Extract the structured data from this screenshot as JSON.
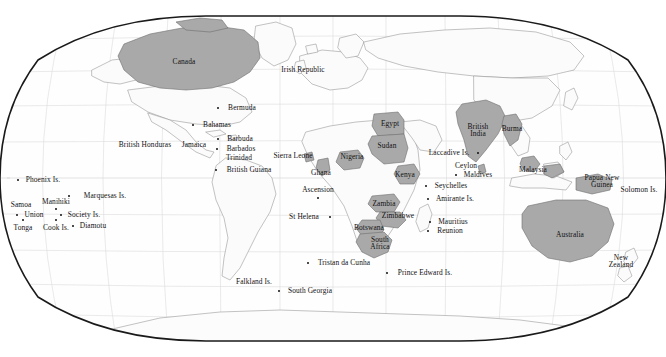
{
  "map": {
    "title": "World Map",
    "projection": "Robinson",
    "colors": {
      "ocean": "#ffffff",
      "land": "#fdfdfd",
      "land_outline": "#8b8b8b",
      "highlight_fill": "#a9a9a9",
      "highlight_outline": "#6e6e6e",
      "graticule": "#d8d8d8",
      "frame": "#1a1a1a",
      "label_text": "#111111"
    },
    "graticule": {
      "visible": true,
      "parallels": [
        75,
        60,
        45,
        30,
        15,
        0,
        -15,
        -30,
        -45,
        -60
      ],
      "meridians": [
        -180,
        -150,
        -120,
        -90,
        -60,
        -30,
        0,
        30,
        60,
        90,
        120,
        150,
        180
      ]
    },
    "labels": [
      {
        "name": "canada",
        "text": "Canada",
        "x": 184,
        "y": 62,
        "dot": false
      },
      {
        "name": "irish-republic",
        "text": "Irish Republic",
        "x": 303,
        "y": 70,
        "dot": false
      },
      {
        "name": "bermuda",
        "text": "Bermuda",
        "x": 242,
        "y": 108,
        "dot": true,
        "dx": -24
      },
      {
        "name": "bahamas",
        "text": "Bahamas",
        "x": 217,
        "y": 125,
        "dot": true,
        "dx": -24
      },
      {
        "name": "barbuda",
        "text": "Barbuda",
        "x": 240,
        "y": 139,
        "dot": true,
        "dx": -22
      },
      {
        "name": "barbados",
        "text": "Barbados",
        "x": 241,
        "y": 149,
        "dot": true,
        "dx": -24
      },
      {
        "name": "trinidad",
        "text": "Trinidad",
        "x": 239,
        "y": 158,
        "dot": false
      },
      {
        "name": "british-honduras",
        "text": "British Honduras",
        "x": 145,
        "y": 145,
        "dot": false
      },
      {
        "name": "jamaica",
        "text": "Jamaica",
        "x": 194,
        "y": 145,
        "dot": false
      },
      {
        "name": "british-guiana",
        "text": "British Guiana",
        "x": 249,
        "y": 170,
        "dot": true,
        "dx": -33
      },
      {
        "name": "sierra-leone",
        "text": "Sierra Leone",
        "x": 293,
        "y": 156,
        "dot": false
      },
      {
        "name": "ghana",
        "text": "Ghana",
        "x": 321,
        "y": 173,
        "dot": false
      },
      {
        "name": "nigeria",
        "text": "Nigeria",
        "x": 352,
        "y": 157,
        "dot": false
      },
      {
        "name": "egypt",
        "text": "Egypt",
        "x": 390,
        "y": 124,
        "dot": false
      },
      {
        "name": "sudan",
        "text": "Sudan",
        "x": 387,
        "y": 146,
        "dot": false
      },
      {
        "name": "kenya",
        "text": "Kenya",
        "x": 405,
        "y": 175,
        "dot": false
      },
      {
        "name": "zambia",
        "text": "Zambia",
        "x": 384,
        "y": 204,
        "dot": false
      },
      {
        "name": "zimbabwe",
        "text": "Zimbabwe",
        "x": 398,
        "y": 216,
        "dot": false
      },
      {
        "name": "botswana",
        "text": "Botswana",
        "x": 369,
        "y": 228,
        "dot": false
      },
      {
        "name": "south-africa",
        "text": "South\nAfrica",
        "x": 380,
        "y": 243,
        "dot": false
      },
      {
        "name": "ascension",
        "text": "Ascension",
        "x": 318,
        "y": 190,
        "dot": true,
        "dx": 0,
        "dy": 8
      },
      {
        "name": "st-helena",
        "text": "St Helena",
        "x": 304,
        "y": 217,
        "dot": true,
        "dx": 26
      },
      {
        "name": "tristan-da-cunha",
        "text": "Tristan da Cunha",
        "x": 344,
        "y": 263,
        "dot": true,
        "dx": -36
      },
      {
        "name": "prince-edward-is",
        "text": "Prince Edward Is.",
        "x": 425,
        "y": 273,
        "dot": true,
        "dx": -38
      },
      {
        "name": "south-georgia",
        "text": "South Georgia",
        "x": 310,
        "y": 291,
        "dot": true,
        "dx": -31
      },
      {
        "name": "falkland-is",
        "text": "Falkland Is.",
        "x": 254,
        "y": 282,
        "dot": false
      },
      {
        "name": "laccadive-is",
        "text": "Laccadive Is.",
        "x": 449,
        "y": 153,
        "dot": true,
        "dx": 29
      },
      {
        "name": "ceylon",
        "text": "Ceylon",
        "x": 466,
        "y": 166,
        "dot": false
      },
      {
        "name": "maldives",
        "text": "Maldives",
        "x": 478,
        "y": 175,
        "dot": true,
        "dx": -22
      },
      {
        "name": "british-india",
        "text": "British\nIndia",
        "x": 478,
        "y": 130,
        "dot": false
      },
      {
        "name": "burma",
        "text": "Burma",
        "x": 512,
        "y": 129,
        "dot": false
      },
      {
        "name": "malaysia",
        "text": "Malaysia",
        "x": 533,
        "y": 170,
        "dot": false
      },
      {
        "name": "seychelles",
        "text": "Seychelles",
        "x": 451,
        "y": 186,
        "dot": true,
        "dx": -25
      },
      {
        "name": "amirante-is",
        "text": "Amirante Is.",
        "x": 455,
        "y": 199,
        "dot": true,
        "dx": -27
      },
      {
        "name": "mauritius",
        "text": "Mauritius",
        "x": 453,
        "y": 222,
        "dot": true,
        "dx": -23
      },
      {
        "name": "reunion",
        "text": "Reunion",
        "x": 450,
        "y": 231,
        "dot": true,
        "dx": -22
      },
      {
        "name": "papua-new-guinea",
        "text": "Papua New\nGuinea",
        "x": 602,
        "y": 181,
        "dot": false
      },
      {
        "name": "solomon-is",
        "text": "Solomon Is.",
        "x": 639,
        "y": 190,
        "dot": false
      },
      {
        "name": "australia",
        "text": "Australia",
        "x": 570,
        "y": 235,
        "dot": false
      },
      {
        "name": "new-zealand",
        "text": "New\nZealand",
        "x": 621,
        "y": 261,
        "dot": false
      },
      {
        "name": "phoenix-is",
        "text": "Phoenix Is.",
        "x": 43,
        "y": 180,
        "dot": true,
        "dx": -25
      },
      {
        "name": "marquesas-is",
        "text": "Marquesas Is.",
        "x": 105,
        "y": 196,
        "dot": true,
        "dx": -36
      },
      {
        "name": "manihiki",
        "text": "Manihiki",
        "x": 56,
        "y": 202,
        "dot": true,
        "dx": 0,
        "dy": 7
      },
      {
        "name": "samoa",
        "text": "Samoa",
        "x": 21,
        "y": 205,
        "dot": false
      },
      {
        "name": "union",
        "text": "Union",
        "x": 34,
        "y": 215,
        "dot": true,
        "dx": -17
      },
      {
        "name": "society-is",
        "text": "Society Is.",
        "x": 84,
        "y": 215,
        "dot": true,
        "dx": -23
      },
      {
        "name": "tonga",
        "text": "Tonga",
        "x": 23,
        "y": 228,
        "dot": true,
        "dx": 0,
        "dy": -8
      },
      {
        "name": "cook-is",
        "text": "Cook Is.",
        "x": 56,
        "y": 228,
        "dot": true,
        "dx": 0,
        "dy": -8
      },
      {
        "name": "diamotu",
        "text": "Diamotu",
        "x": 93,
        "y": 226,
        "dot": true,
        "dx": -20
      }
    ]
  }
}
